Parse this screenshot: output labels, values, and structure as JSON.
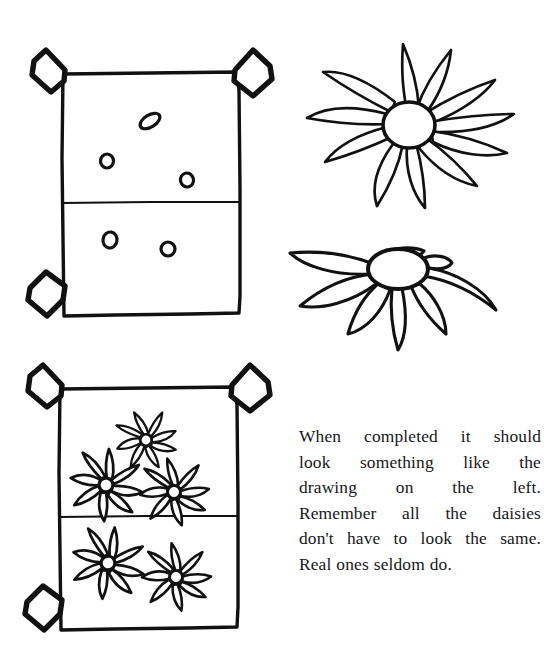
{
  "page": {
    "width": 557,
    "height": 667,
    "background_color": "#ffffff",
    "ink_color": "#111111",
    "kind": "scanned-illustration-page"
  },
  "instruction": {
    "paragraph": "When completed it should look something like the drawing on the left. Remember all the daisies don't have to look the same. Real ones seldom do.",
    "lines": [
      "When completed it should",
      "look something like the",
      "drawing on the left.",
      "Remember all the daisies",
      "don't have to look the same.",
      "Real ones seldom do."
    ],
    "text_color": "#17161a"
  },
  "figures": {
    "tray_with_seeds": {
      "label": "seed tray with scattered seeds",
      "caption": "",
      "seed_count": 5,
      "compartments": 2,
      "corner_tabs": 3
    },
    "flower_face_on": {
      "label": "daisy seen face on",
      "petal_count": 11,
      "center_shape": "oval"
    },
    "flower_side_on": {
      "label": "daisy seen at an angle",
      "petal_count": 8,
      "center_shape": "oval"
    },
    "tray_with_flowers": {
      "label": "seed tray with grown daisies",
      "flower_count": 5,
      "compartments": 2,
      "corner_tabs": 3
    }
  }
}
